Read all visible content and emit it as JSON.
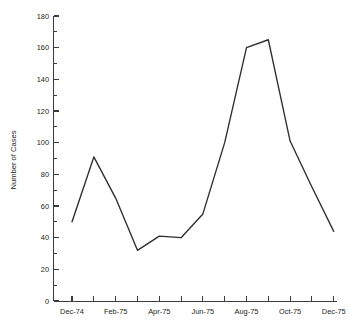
{
  "chart_data": {
    "type": "line",
    "title": "",
    "subtitle": "",
    "xlabel": "",
    "ylabel": "Number of Cases",
    "categories": [
      "Dec-74",
      "Jan-75",
      "Feb-75",
      "Mar-75",
      "Apr-75",
      "May-75",
      "Jun-75",
      "Jul-75",
      "Aug-75",
      "Sep-75",
      "Oct-75",
      "Nov-75",
      "Dec-75"
    ],
    "x_tick_labels": [
      "Dec-74",
      "Feb-75",
      "Apr-75",
      "Jun-75",
      "Aug-75",
      "Oct-75",
      "Dec-75"
    ],
    "x_tick_label_every": 2,
    "values": [
      50,
      91,
      65,
      32,
      41,
      40,
      55,
      100,
      160,
      165,
      101,
      72,
      44
    ],
    "series": [
      {
        "name": "Number of Cases",
        "values": [
          50,
          91,
          65,
          32,
          41,
          40,
          55,
          100,
          160,
          165,
          101,
          72,
          44
        ]
      }
    ],
    "ylim": [
      0,
      180
    ],
    "y_major_ticks": [
      0,
      20,
      40,
      60,
      80,
      100,
      120,
      140,
      160,
      180
    ],
    "y_minor_ticks": [
      10,
      30,
      50,
      70,
      90,
      110,
      130,
      150,
      170
    ],
    "y_tick_labels": [
      "0",
      "20",
      "40",
      "60",
      "80",
      "100",
      "120",
      "140",
      "160",
      "180"
    ],
    "grid": false,
    "legend": false,
    "legend_position": "none",
    "line_color": "#2f2d2e",
    "axis_color": "#3b3a3c",
    "background_color": "#ffffff",
    "annotations": []
  },
  "axes": {
    "y_title": "Number of Cases"
  }
}
